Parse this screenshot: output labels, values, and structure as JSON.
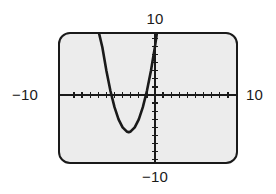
{
  "figure": {
    "kind": "graphing-calculator-viewing-window",
    "frame_color": "#1a1a1a",
    "screen_fill": "#ececec",
    "curve_color": "#1a1a1a"
  },
  "labels": {
    "top": "10",
    "bottom": "−10",
    "left": "−10",
    "right": "10"
  },
  "chart_data": {
    "type": "line",
    "title": "",
    "xlabel": "",
    "ylabel": "",
    "xlim": [
      -10,
      10
    ],
    "ylim": [
      -10,
      10
    ],
    "xticks_step": 1,
    "yticks_step": 1,
    "grid": false,
    "legend": false,
    "axis_tick_labels": {
      "x_min": "−10",
      "x_max": "10",
      "y_min": "−10",
      "y_max": "10"
    },
    "series": [
      {
        "name": "parabola",
        "equation": "y = x^2 + 6.5x + 6",
        "vertex": [
          -3.25,
          -4.6
        ],
        "x_intercepts": [
          -6.4,
          -0.1
        ],
        "x": [
          -7.2,
          -7.0,
          -6.5,
          -6.0,
          -5.5,
          -5.0,
          -4.5,
          -4.0,
          -3.5,
          -3.25,
          -3.0,
          -2.5,
          -2.0,
          -1.5,
          -1.0,
          -0.5,
          0.0,
          0.5,
          1.0,
          1.4
        ],
        "y": [
          11.0,
          8.0,
          5.9,
          3.0,
          0.5,
          -1.5,
          -3.0,
          -4.0,
          -4.5,
          -4.6,
          -4.5,
          -4.0,
          -3.0,
          -1.5,
          0.5,
          3.0,
          6.0,
          9.5,
          10.5,
          11.2
        ]
      }
    ]
  }
}
